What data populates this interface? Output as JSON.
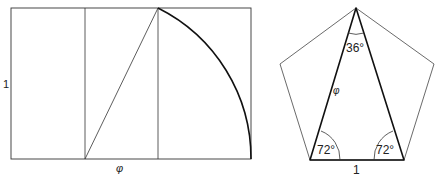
{
  "rectangle_figure": {
    "height_label": "1",
    "width_label": "φ"
  },
  "pentagon_figure": {
    "apex_angle": "36°",
    "left_base_angle": "72°",
    "right_base_angle": "72°",
    "side_label": "φ",
    "base_label": "1"
  },
  "colors": {
    "stroke": "#222222",
    "background": "#ffffff"
  }
}
